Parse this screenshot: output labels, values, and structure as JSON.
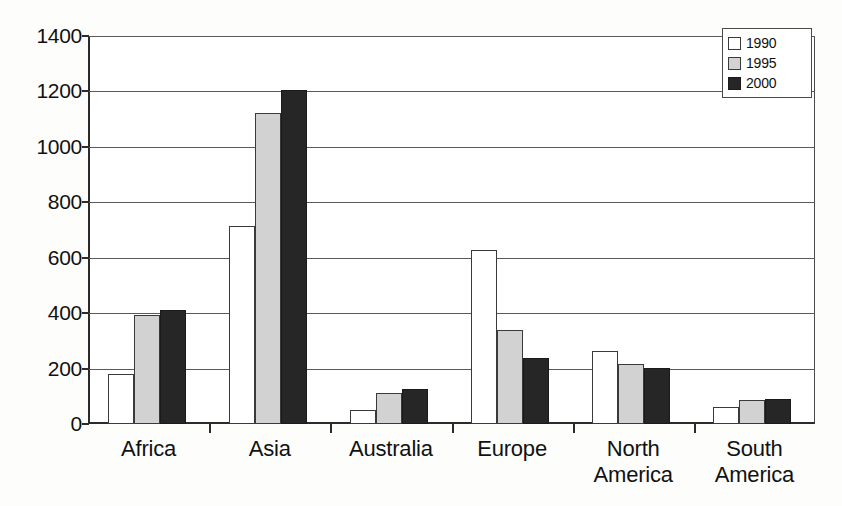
{
  "chart_data": {
    "type": "bar",
    "title": "",
    "subtitle": "",
    "xlabel": "",
    "ylabel": "",
    "ylim": [
      0,
      1400
    ],
    "ytick_values": [
      0,
      200,
      400,
      600,
      800,
      1000,
      1200,
      1400
    ],
    "ytick_labels": [
      "0",
      "200",
      "400",
      "600",
      "800",
      "1000",
      "1200",
      "1400"
    ],
    "grid": true,
    "grid_axis": "y",
    "legend_position": "top-right",
    "categories": [
      "Africa",
      "Asia",
      "Australia",
      "Europe",
      "North America",
      "South America"
    ],
    "category_label_lines": [
      [
        "Africa"
      ],
      [
        "Asia"
      ],
      [
        "Australia"
      ],
      [
        "Europe"
      ],
      [
        "North",
        "America"
      ],
      [
        "South",
        "America"
      ]
    ],
    "series": [
      {
        "name": "1990",
        "color": "#ffffff",
        "values": [
          180,
          715,
          52,
          628,
          262,
          62
        ]
      },
      {
        "name": "1995",
        "color": "#d2d2d2",
        "values": [
          393,
          1122,
          113,
          338,
          216,
          85
        ]
      },
      {
        "name": "2000",
        "color": "#262626",
        "values": [
          410,
          1205,
          126,
          238,
          202,
          92
        ]
      }
    ]
  },
  "legend": {
    "items": [
      {
        "label": "1990",
        "swatch": "white-square-icon"
      },
      {
        "label": "1995",
        "swatch": "gray-square-icon"
      },
      {
        "label": "2000",
        "swatch": "black-square-icon"
      }
    ]
  },
  "colors": {
    "series_1990": "#ffffff",
    "series_1995": "#d2d2d2",
    "series_2000": "#262626",
    "axis": "#2b2b2b",
    "gridline": "#5a5a5a",
    "background": "#ffffff"
  }
}
